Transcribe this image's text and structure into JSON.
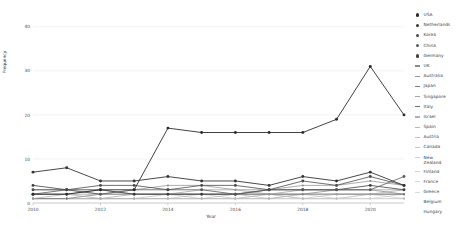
{
  "chart_data": {
    "type": "line",
    "title": "",
    "xlabel": "Year",
    "ylabel": "Frequency",
    "xlim": [
      2010,
      2021
    ],
    "ylim": [
      0,
      42
    ],
    "grid": true,
    "legend_position": "right",
    "x": [
      2010,
      2011,
      2012,
      2013,
      2014,
      2015,
      2016,
      2017,
      2018,
      2019,
      2020,
      2021
    ],
    "xticks": [
      "2010",
      "2012",
      "2014",
      "2016",
      "2018",
      "2020"
    ],
    "xtick_values": [
      2010,
      2012,
      2014,
      2016,
      2018,
      2020
    ],
    "yticks": [
      "0",
      "10",
      "20",
      "30",
      "40"
    ],
    "ytick_values": [
      0,
      10,
      20,
      30,
      40
    ],
    "series": [
      {
        "name": "USA",
        "marker": "dot",
        "color": "#2b2b2b",
        "width": 0.9,
        "values": [
          2,
          2,
          3,
          3,
          17,
          16,
          16,
          16,
          16,
          19,
          31,
          20
        ]
      },
      {
        "name": "Netherlands",
        "marker": "dot",
        "color": "#343434",
        "width": 0.9,
        "values": [
          7,
          8,
          5,
          5,
          6,
          5,
          5,
          4,
          6,
          5,
          7,
          4
        ]
      },
      {
        "name": "Korea",
        "marker": "dot",
        "color": "#4a4a4a",
        "width": 0.8,
        "values": [
          3,
          3,
          4,
          4,
          3,
          4,
          4,
          3,
          5,
          4,
          6,
          4
        ]
      },
      {
        "name": "China",
        "marker": "dot",
        "color": "#5a5a5a",
        "width": 0.8,
        "values": [
          2,
          3,
          2,
          3,
          3,
          3,
          2,
          3,
          3,
          3,
          3,
          6
        ]
      },
      {
        "name": "Germany",
        "marker": "dot",
        "color": "#3d3d3d",
        "width": 0.8,
        "values": [
          4,
          3,
          3,
          2,
          2,
          2,
          2,
          3,
          3,
          3,
          4,
          3
        ]
      },
      {
        "name": "UK",
        "marker": "dash",
        "color": "#8a8a8a",
        "width": 0.7,
        "values": [
          3,
          3,
          2,
          3,
          4,
          4,
          3,
          3,
          4,
          4,
          5,
          4
        ]
      },
      {
        "name": "Australia",
        "marker": "dash",
        "color": "#9a9a9a",
        "width": 0.7,
        "values": [
          2,
          2,
          2,
          2,
          2,
          3,
          3,
          2,
          3,
          3,
          3,
          3
        ]
      },
      {
        "name": "Japan",
        "marker": "dash",
        "color": "#7d7d7d",
        "width": 0.7,
        "values": [
          2,
          2,
          3,
          2,
          2,
          2,
          2,
          2,
          2,
          3,
          3,
          2
        ]
      },
      {
        "name": "Singapore",
        "marker": "dash",
        "color": "#a5a5a5",
        "width": 0.7,
        "values": [
          1,
          2,
          1,
          2,
          2,
          2,
          2,
          2,
          2,
          2,
          2,
          3
        ]
      },
      {
        "name": "Italy",
        "marker": "dash",
        "color": "#6e6e6e",
        "width": 0.7,
        "values": [
          1,
          1,
          2,
          2,
          2,
          2,
          2,
          2,
          2,
          2,
          2,
          2
        ]
      },
      {
        "name": "Israel",
        "marker": "dash",
        "color": "#b0b0b0",
        "width": 0.6,
        "values": [
          1,
          1,
          1,
          1,
          2,
          1,
          2,
          1,
          2,
          2,
          2,
          2
        ]
      },
      {
        "name": "Spain",
        "marker": "dash",
        "color": "#b8b8b8",
        "width": 0.6,
        "values": [
          1,
          1,
          1,
          1,
          1,
          2,
          1,
          2,
          1,
          2,
          2,
          2
        ]
      },
      {
        "name": "Austria",
        "marker": "dash",
        "color": "#c0c0c0",
        "width": 0.6,
        "values": [
          1,
          1,
          1,
          1,
          1,
          1,
          1,
          1,
          2,
          1,
          2,
          1
        ]
      },
      {
        "name": "Canada",
        "marker": "dash",
        "color": "#c6c6c6",
        "width": 0.6,
        "values": [
          1,
          1,
          1,
          1,
          1,
          1,
          1,
          2,
          1,
          1,
          2,
          2
        ]
      },
      {
        "name": "New Zealand",
        "marker": "dash",
        "color": "#cccccc",
        "width": 0.6,
        "values": [
          1,
          1,
          1,
          1,
          1,
          1,
          1,
          1,
          1,
          1,
          1,
          2
        ]
      },
      {
        "name": "Finland",
        "marker": "dash",
        "color": "#d2d2d2",
        "width": 0.6,
        "values": [
          1,
          1,
          1,
          1,
          1,
          1,
          1,
          1,
          1,
          1,
          1,
          1
        ]
      },
      {
        "name": "France",
        "marker": "dash",
        "color": "#d6d6d6",
        "width": 0.6,
        "values": [
          1,
          1,
          1,
          1,
          1,
          1,
          1,
          1,
          1,
          1,
          1,
          1
        ]
      },
      {
        "name": "Greece",
        "marker": "dash",
        "color": "#dadada",
        "width": 0.6,
        "values": [
          1,
          1,
          1,
          1,
          1,
          1,
          1,
          1,
          1,
          1,
          1,
          1
        ]
      },
      {
        "name": "Belgium",
        "marker": "none",
        "color": "#dedede",
        "width": 0.5,
        "values": [
          1,
          1,
          1,
          1,
          1,
          1,
          1,
          1,
          1,
          1,
          1,
          1
        ]
      },
      {
        "name": "Hungary",
        "marker": "none",
        "color": "#e2e2e2",
        "width": 0.5,
        "values": [
          1,
          1,
          1,
          1,
          1,
          1,
          1,
          1,
          1,
          1,
          1,
          1
        ]
      }
    ]
  },
  "legend": {
    "entries": [
      {
        "label": "USA",
        "marker": "dot",
        "color": "#2b2b2b"
      },
      {
        "label": "Netherlands",
        "marker": "dot",
        "color": "#343434"
      },
      {
        "label": "Korea",
        "marker": "dot",
        "color": "#4a4a4a"
      },
      {
        "label": "China",
        "marker": "dot",
        "color": "#5a5a5a"
      },
      {
        "label": "Germany",
        "marker": "dot",
        "color": "#3d3d3d"
      },
      {
        "label": "UK",
        "marker": "dash",
        "color": "#8a8a8a"
      },
      {
        "label": "Australia",
        "marker": "dash",
        "color": "#9a9a9a"
      },
      {
        "label": "Japan",
        "marker": "dash",
        "color": "#7d7d7d"
      },
      {
        "label": "Singapore",
        "marker": "dash",
        "color": "#a5a5a5"
      },
      {
        "label": "Italy",
        "marker": "dash",
        "color": "#6e6e6e"
      },
      {
        "label": "Israel",
        "marker": "dash",
        "color": "#b0b0b0"
      },
      {
        "label": "Spain",
        "marker": "dash",
        "color": "#b8b8b8"
      },
      {
        "label": "Austria",
        "marker": "dash",
        "color": "#c0c0c0"
      },
      {
        "label": "Canada",
        "marker": "dash",
        "color": "#c6c6c6"
      },
      {
        "label": "New\nZealand",
        "marker": "dash",
        "color": "#cccccc"
      },
      {
        "label": "Finland",
        "marker": "dash",
        "color": "#d2d2d2"
      },
      {
        "label": "France",
        "marker": "dash",
        "color": "#d6d6d6"
      },
      {
        "label": "Greece",
        "marker": "dash",
        "color": "#dadada"
      },
      {
        "label": "Belgium",
        "marker": "none",
        "color": "#dedede"
      },
      {
        "label": "Hungary",
        "marker": "none",
        "color": "#e2e2e2"
      }
    ]
  },
  "colors": {
    "grid": "#ececec",
    "axis": "#bdbdbd",
    "text": "#3a3a3a",
    "background": "#ffffff"
  }
}
